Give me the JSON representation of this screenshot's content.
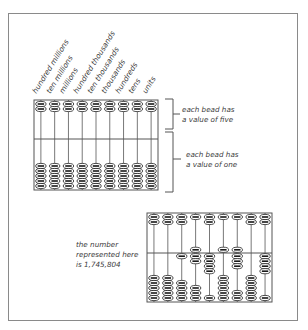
{
  "diagram": {
    "place_labels": [
      "hundred millions",
      "ten millions",
      "millions",
      "hundred thousands",
      "ten thousands",
      "thousands",
      "hundreds",
      "tens",
      "units"
    ],
    "upper_bracket_caption": [
      "each bead has",
      "a value of five"
    ],
    "lower_bracket_caption": [
      "each bead has",
      "a value of one"
    ],
    "example_caption": [
      "the number",
      "represented here",
      "is 1,745,804"
    ],
    "example_number": "1,745,804",
    "example_digits": [
      0,
      0,
      1,
      7,
      4,
      5,
      8,
      0,
      4
    ],
    "rods": 9,
    "upper_beads_per_rod": 2,
    "lower_beads_per_rod": 5,
    "colors": {
      "line": "#555555",
      "bead_fill": "#ffffff",
      "bead_core": "#1a1a1a",
      "border": "#8a8a8a"
    }
  }
}
